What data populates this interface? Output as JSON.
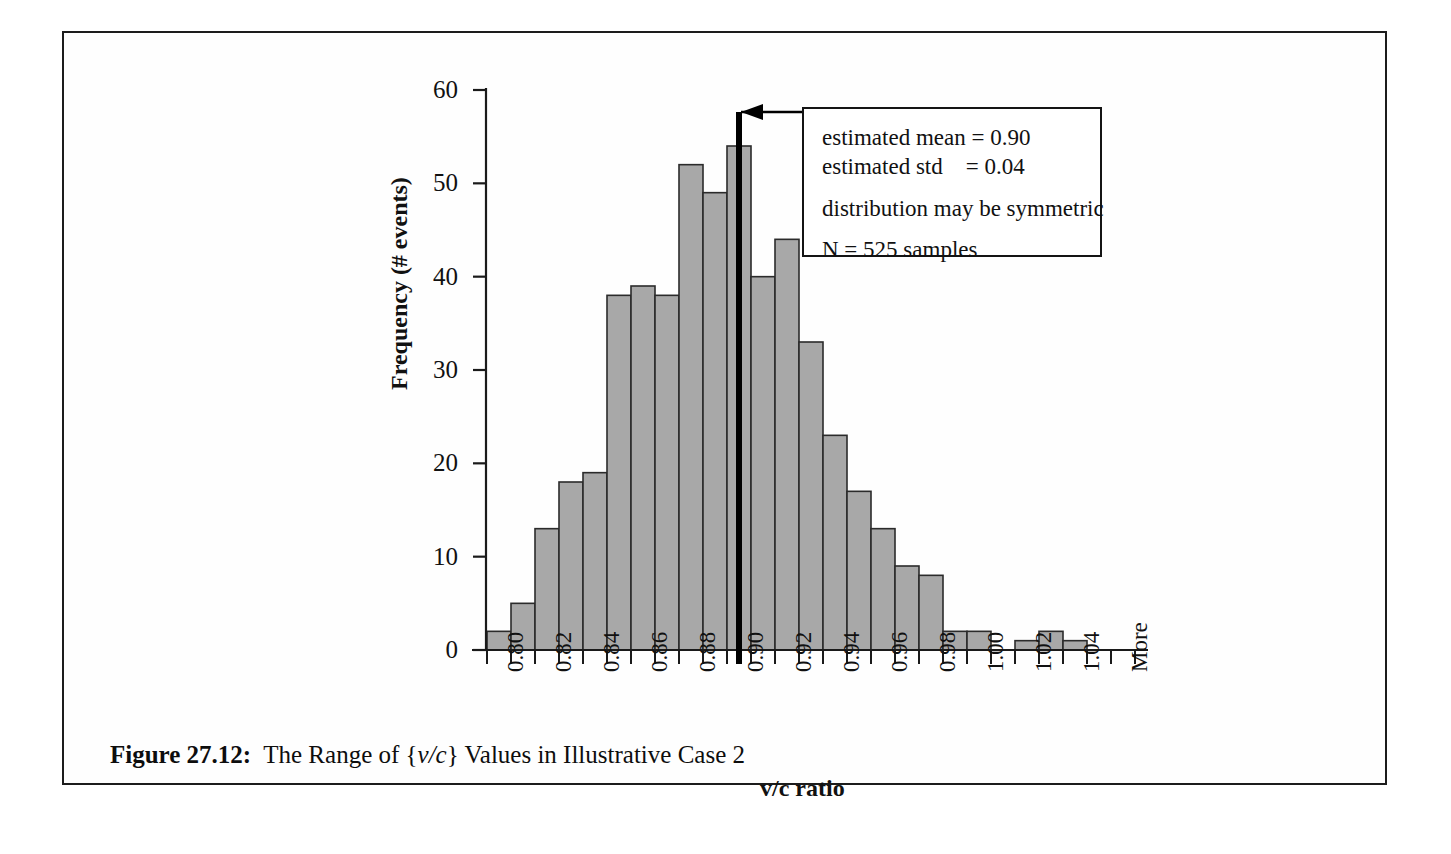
{
  "figure": {
    "caption_label": "Figure 27.12:",
    "caption_text_a": "The Range of {",
    "caption_italic": "v/c",
    "caption_text_b": "} Values in Illustrative Case 2"
  },
  "annotation": {
    "line1": "estimated mean = 0.90",
    "line2": "estimated std    = 0.04",
    "line3": "distribution may be symmetric",
    "line4": "N = 525 samples",
    "pointer_label": "mean-marker-arrow"
  },
  "axes": {
    "ylabel": "Frequency (# events)",
    "xlabel": "v/c ratio",
    "yticks": [
      "0",
      "10",
      "20",
      "30",
      "40",
      "50",
      "60"
    ],
    "xticks": [
      "0.80",
      "",
      "0.82",
      "",
      "0.84",
      "",
      "0.86",
      "",
      "0.88",
      "",
      "0.90",
      "",
      "0.92",
      "",
      "0.94",
      "",
      "0.96",
      "",
      "0.98",
      "",
      "1.00",
      "",
      "1.02",
      "",
      "1.04",
      "",
      "More"
    ]
  },
  "colors": {
    "bar_fill": "#a8a8a8",
    "bar_stroke": "#2b2b2b",
    "axis": "#1a1a1a",
    "mean_line": "#000000",
    "frame": "#1c1c1c"
  },
  "chart_data": {
    "type": "bar",
    "title": "The Range of {v/c} Values in Illustrative Case 2",
    "xlabel": "v/c ratio",
    "ylabel": "Frequency (# events)",
    "ylim": [
      0,
      60
    ],
    "ytick_step": 10,
    "grid": false,
    "legend": "none",
    "bin_width": 0.01,
    "categories": [
      "0.80",
      "0.81",
      "0.82",
      "0.83",
      "0.84",
      "0.85",
      "0.86",
      "0.87",
      "0.88",
      "0.89",
      "0.90",
      "0.91",
      "0.92",
      "0.93",
      "0.94",
      "0.95",
      "0.96",
      "0.97",
      "0.98",
      "0.99",
      "1.00",
      "1.01",
      "1.02",
      "1.03",
      "1.04",
      "1.05",
      "More"
    ],
    "values": [
      2,
      5,
      13,
      18,
      19,
      38,
      39,
      38,
      52,
      49,
      54,
      40,
      44,
      33,
      23,
      17,
      13,
      9,
      8,
      2,
      2,
      0,
      1,
      2,
      1,
      0,
      0
    ],
    "annotations": {
      "estimated_mean": 0.9,
      "estimated_std": 0.04,
      "n_samples": 525,
      "note": "distribution may be symmetric",
      "mean_marker_x": "0.905"
    }
  }
}
